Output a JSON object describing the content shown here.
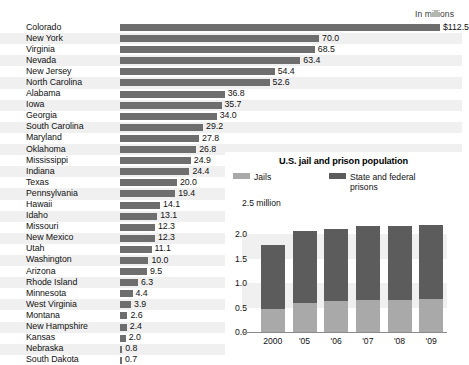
{
  "main": {
    "units_label": "In millions",
    "value_prefix_first": "$",
    "bar_color": "#6e6e6e",
    "stripe_color": "#f0f0f0",
    "rows": [
      {
        "state": "Colorado",
        "value": 112.5,
        "display": "$112.5"
      },
      {
        "state": "New York",
        "value": 70.0,
        "display": "70.0"
      },
      {
        "state": "Virginia",
        "value": 68.5,
        "display": "68.5"
      },
      {
        "state": "Nevada",
        "value": 63.4,
        "display": "63.4"
      },
      {
        "state": "New Jersey",
        "value": 54.4,
        "display": "54.4"
      },
      {
        "state": "North Carolina",
        "value": 52.6,
        "display": "52.6"
      },
      {
        "state": "Alabama",
        "value": 36.8,
        "display": "36.8"
      },
      {
        "state": "Iowa",
        "value": 35.7,
        "display": "35.7"
      },
      {
        "state": "Georgia",
        "value": 34.0,
        "display": "34.0"
      },
      {
        "state": "South Carolina",
        "value": 29.2,
        "display": "29.2"
      },
      {
        "state": "Maryland",
        "value": 27.8,
        "display": "27.8"
      },
      {
        "state": "Oklahoma",
        "value": 26.8,
        "display": "26.8"
      },
      {
        "state": "Mississippi",
        "value": 24.9,
        "display": "24.9"
      },
      {
        "state": "Indiana",
        "value": 24.4,
        "display": "24.4"
      },
      {
        "state": "Texas",
        "value": 20.0,
        "display": "20.0"
      },
      {
        "state": "Pennsylvania",
        "value": 19.4,
        "display": "19.4"
      },
      {
        "state": "Hawaii",
        "value": 14.1,
        "display": "14.1"
      },
      {
        "state": "Idaho",
        "value": 13.1,
        "display": "13.1"
      },
      {
        "state": "Missouri",
        "value": 12.3,
        "display": "12.3"
      },
      {
        "state": "New Mexico",
        "value": 12.3,
        "display": "12.3"
      },
      {
        "state": "Utah",
        "value": 11.1,
        "display": "11.1"
      },
      {
        "state": "Washington",
        "value": 10.0,
        "display": "10.0"
      },
      {
        "state": "Arizona",
        "value": 9.5,
        "display": "9.5"
      },
      {
        "state": "Rhode Island",
        "value": 6.3,
        "display": "6.3"
      },
      {
        "state": "Minnesota",
        "value": 4.4,
        "display": "4.4"
      },
      {
        "state": "West Virginia",
        "value": 3.9,
        "display": "3.9"
      },
      {
        "state": "Montana",
        "value": 2.6,
        "display": "2.6"
      },
      {
        "state": "New Hampshire",
        "value": 2.4,
        "display": "2.4"
      },
      {
        "state": "Kansas",
        "value": 2.0,
        "display": "2.0"
      },
      {
        "state": "Nebraska",
        "value": 0.8,
        "display": "0.8"
      },
      {
        "state": "South Dakota",
        "value": 0.7,
        "display": "0.7"
      }
    ]
  },
  "inset": {
    "title": "U.S. jail and prison population",
    "top_label": "2.5 million",
    "legend": [
      {
        "name": "Jails",
        "color": "#a9a9a9"
      },
      {
        "name": "State and federal prisons",
        "color": "#5c5c5c"
      }
    ],
    "yticks": [
      "2.0",
      "1.5",
      "1.0",
      "0.5",
      "0.0"
    ],
    "xticks": [
      "2000",
      "'05",
      "'06",
      "'07",
      "'08",
      "'09"
    ]
  },
  "chart_data": [
    {
      "type": "bar",
      "orientation": "horizontal",
      "title": "",
      "subtitle": "In millions",
      "xlabel": "",
      "ylabel": "",
      "grid": false,
      "categories": [
        "Colorado",
        "New York",
        "Virginia",
        "Nevada",
        "New Jersey",
        "North Carolina",
        "Alabama",
        "Iowa",
        "Georgia",
        "South Carolina",
        "Maryland",
        "Oklahoma",
        "Mississippi",
        "Indiana",
        "Texas",
        "Pennsylvania",
        "Hawaii",
        "Idaho",
        "Missouri",
        "New Mexico",
        "Utah",
        "Washington",
        "Arizona",
        "Rhode Island",
        "Minnesota",
        "West Virginia",
        "Montana",
        "New Hampshire",
        "Kansas",
        "Nebraska",
        "South Dakota"
      ],
      "values": [
        112.5,
        70.0,
        68.5,
        63.4,
        54.4,
        52.6,
        36.8,
        35.7,
        34.0,
        29.2,
        27.8,
        26.8,
        24.9,
        24.4,
        20.0,
        19.4,
        14.1,
        13.1,
        12.3,
        12.3,
        11.1,
        10.0,
        9.5,
        6.3,
        4.4,
        3.9,
        2.6,
        2.4,
        2.0,
        0.8,
        0.7
      ],
      "data_labels": [
        "$112.5",
        "70.0",
        "68.5",
        "63.4",
        "54.4",
        "52.6",
        "36.8",
        "35.7",
        "34.0",
        "29.2",
        "27.8",
        "26.8",
        "24.9",
        "24.4",
        "20.0",
        "19.4",
        "14.1",
        "13.1",
        "12.3",
        "12.3",
        "11.1",
        "10.0",
        "9.5",
        "6.3",
        "4.4",
        "3.9",
        "2.6",
        "2.4",
        "2.0",
        "0.8",
        "0.7"
      ],
      "xlim": [
        0,
        112.5
      ],
      "units": "millions of dollars",
      "bar_color": "#6e6e6e"
    },
    {
      "type": "bar",
      "stacked": true,
      "orientation": "vertical",
      "title": "U.S. jail and prison population",
      "xlabel": "",
      "ylabel": "millions",
      "ylim": [
        0.0,
        2.5
      ],
      "yticks": [
        0.0,
        0.5,
        1.0,
        1.5,
        2.0
      ],
      "ytop_label": "2.5 million",
      "grid": true,
      "legend_position": "top",
      "categories": [
        "2000",
        "'05",
        "'06",
        "'07",
        "'08",
        "'09"
      ],
      "series": [
        {
          "name": "Jails",
          "color": "#a9a9a9",
          "values": [
            0.47,
            0.6,
            0.63,
            0.65,
            0.66,
            0.67
          ]
        },
        {
          "name": "State and federal prisons",
          "color": "#5c5c5c",
          "values": [
            1.31,
            1.46,
            1.48,
            1.52,
            1.52,
            1.52
          ]
        }
      ],
      "totals": [
        1.78,
        2.06,
        2.11,
        2.17,
        2.18,
        2.19
      ]
    }
  ]
}
